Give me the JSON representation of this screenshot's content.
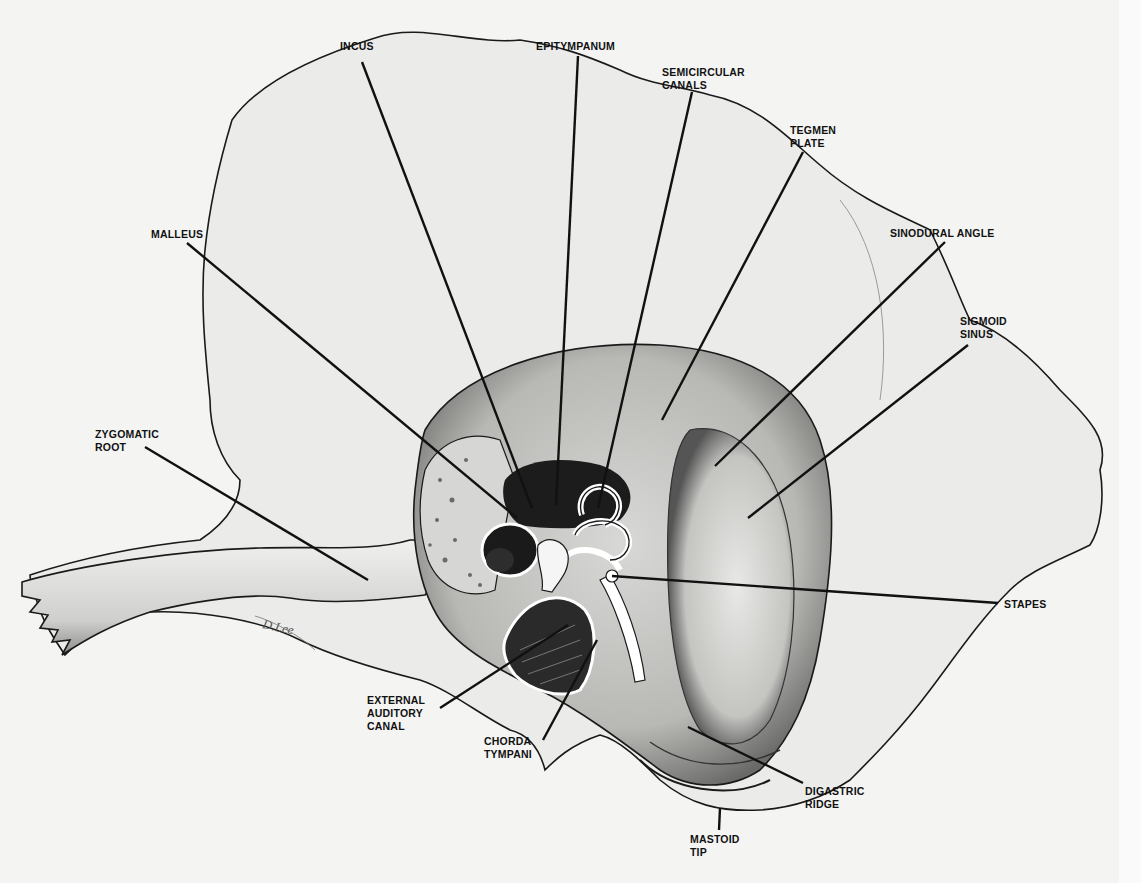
{
  "figure": {
    "signature": "D. Lee",
    "colors": {
      "background": "#f4f4f3",
      "ink": "#111111",
      "bone": "#ebebea",
      "shadow": "#3a3a3a"
    }
  },
  "labels": [
    {
      "id": "incus",
      "text": "INCUS",
      "x": 340,
      "y": 47,
      "line": [
        362,
        62,
        532,
        508
      ]
    },
    {
      "id": "epitympanum",
      "text": "EPITYMPANUM",
      "x": 536,
      "y": 40,
      "line": [
        578,
        56,
        556,
        505
      ]
    },
    {
      "id": "semicircular-canals",
      "text": "SEMICIRCULAR\nCANALS",
      "x": 662,
      "y": 66,
      "line": [
        692,
        92,
        598,
        508
      ]
    },
    {
      "id": "tegmen-plate",
      "text": "TEGMEN\nPLATE",
      "x": 790,
      "y": 124,
      "line": [
        803,
        152,
        662,
        420
      ]
    },
    {
      "id": "sinodural-angle",
      "text": "SINODURAL ANGLE",
      "x": 890,
      "y": 227,
      "line": [
        945,
        242,
        715,
        466
      ]
    },
    {
      "id": "sigmoid-sinus",
      "text": "SIGMOID\nSINUS",
      "x": 960,
      "y": 318,
      "line": [
        968,
        345,
        748,
        518
      ]
    },
    {
      "id": "malleus",
      "text": "MALLEUS",
      "x": 151,
      "y": 228,
      "line": [
        187,
        243,
        517,
        518
      ]
    },
    {
      "id": "zygomatic-root",
      "text": "ZYGOMATIC\nROOT",
      "x": 95,
      "y": 433,
      "line": [
        145,
        447,
        368,
        580
      ]
    },
    {
      "id": "stapes",
      "text": "STAPES",
      "x": 1004,
      "y": 598,
      "line": [
        998,
        603,
        612,
        576
      ]
    },
    {
      "id": "external-auditory-canal",
      "text": "EXTERNAL\nAUDITORY\nCANAL",
      "x": 367,
      "y": 694,
      "line": [
        440,
        708,
        568,
        625
      ]
    },
    {
      "id": "chorda-tympani",
      "text": "CHORDA\nTYMPANI",
      "x": 484,
      "y": 735,
      "line": [
        543,
        740,
        597,
        640
      ]
    },
    {
      "id": "digastric-ridge",
      "text": "DIGASTRIC\nRIDGE",
      "x": 805,
      "y": 785,
      "line": [
        803,
        783,
        688,
        727
      ]
    },
    {
      "id": "mastoid-tip",
      "text": "MASTOID\nTIP",
      "x": 690,
      "y": 833,
      "line": [
        719,
        830,
        720,
        808
      ]
    }
  ]
}
